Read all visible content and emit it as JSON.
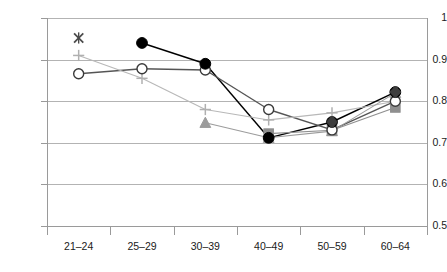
{
  "chart_data": {
    "type": "line",
    "title": "",
    "subtitle": "",
    "xlabel": "",
    "ylabel": "",
    "categories": [
      "21–24",
      "25–29",
      "30–39",
      "40–49",
      "50–59",
      "60–64"
    ],
    "ylim": [
      0.5,
      1.0
    ],
    "ytick_labels": [
      "1",
      "0.9",
      "0.8",
      "0.7",
      "0.6",
      "0.5"
    ],
    "ytick_values": [
      1.0,
      0.9,
      0.8,
      0.7,
      0.6,
      0.5
    ],
    "grid": "horizontal",
    "legend": "none",
    "series": [
      {
        "name": "series-1",
        "marker": "filled-circle",
        "color": "#000000",
        "line_color": "#000000",
        "values": [
          null,
          0.94,
          0.89,
          0.712,
          0.75,
          0.822
        ]
      },
      {
        "name": "series-2",
        "marker": "open-circle",
        "color": "#3a3a3a",
        "line_color": "#555555",
        "values": [
          0.866,
          0.878,
          0.875,
          0.78,
          0.731,
          0.8
        ]
      },
      {
        "name": "series-3",
        "marker": "plus",
        "color": "#b0b0b0",
        "line_color": "#b8b8b8",
        "values": [
          0.91,
          0.855,
          0.78,
          0.755,
          0.772,
          0.8
        ]
      },
      {
        "name": "series-4",
        "marker": "cross",
        "color": "#4a4a4a",
        "line_color": "#9a9a9a",
        "values": [
          0.952,
          null,
          null,
          null,
          null,
          null
        ]
      },
      {
        "name": "series-5",
        "marker": "square",
        "color": "#8f8f8f",
        "line_color": "#8f8f8f",
        "values": [
          null,
          null,
          null,
          0.722,
          0.73,
          0.785
        ]
      },
      {
        "name": "series-6",
        "marker": "triangle",
        "color": "#9c9c9c",
        "line_color": "#9c9c9c",
        "values": [
          null,
          null,
          0.748,
          0.712,
          0.728,
          0.82
        ]
      }
    ],
    "colors": {
      "grid": "#b3b3b3",
      "axis": "#9a9a9a",
      "tick_text": "#1a1a1a",
      "background": "#ffffff"
    },
    "geometry": {
      "plot_left": 47,
      "plot_right": 427,
      "plot_top": 18,
      "plot_bottom": 226
    }
  }
}
